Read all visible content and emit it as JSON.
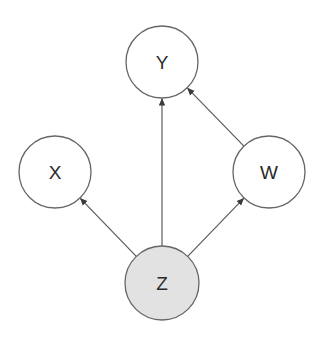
{
  "diagram": {
    "type": "directed-acyclic-graph",
    "colors": {
      "background": "#ffffff",
      "node_stroke": "#666666",
      "node_fill_default": "#ffffff",
      "node_fill_observed": "#e2e2e2",
      "edge_stroke": "#5a5a5a",
      "label": "#2a2a2a"
    },
    "nodes": [
      {
        "id": "Y",
        "label": "Y",
        "cx": 162,
        "cy": 62,
        "r": 36,
        "shaded": false
      },
      {
        "id": "X",
        "label": "X",
        "cx": 55,
        "cy": 172,
        "r": 36,
        "shaded": false
      },
      {
        "id": "W",
        "label": "W",
        "cx": 269,
        "cy": 172,
        "r": 36,
        "shaded": false
      },
      {
        "id": "Z",
        "label": "Z",
        "cx": 162,
        "cy": 283,
        "r": 37,
        "shaded": true
      }
    ],
    "edges": [
      {
        "from": "Z",
        "to": "Y"
      },
      {
        "from": "W",
        "to": "Y"
      },
      {
        "from": "Z",
        "to": "X"
      },
      {
        "from": "Z",
        "to": "W"
      }
    ]
  }
}
